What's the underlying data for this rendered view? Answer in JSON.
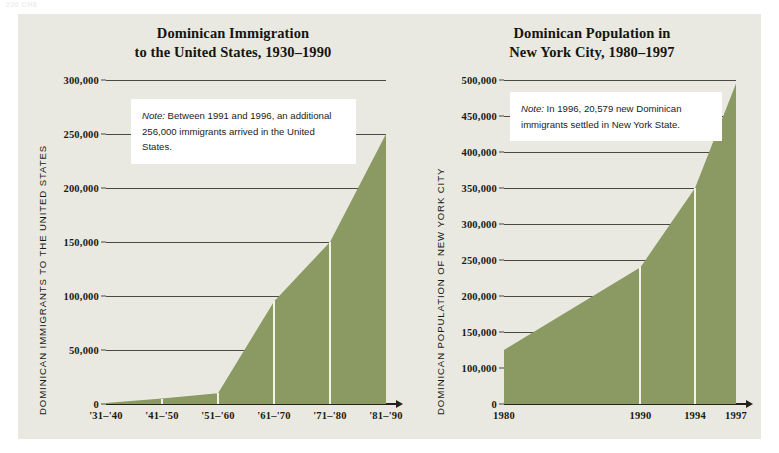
{
  "page_header": "226  CH8",
  "colors": {
    "panel_background": "#e9e9e1",
    "area_fill": "#8a9a62",
    "gridline": "#4a4a40",
    "axis": "#23231c",
    "text": "#1a1a14",
    "note_background": "#ffffff"
  },
  "charts": [
    {
      "id": "dominican-immigration-us",
      "title_line1": "Dominican Immigration",
      "title_line2": "to the United States, 1930–1990",
      "ylabel": "DOMINICAN IMMIGRANTS TO THE UNITED STATES",
      "note_prefix": "Note:",
      "note_body": " Between 1991 and 1996, an additional 256,000 immigrants arrived in the United States.",
      "yticks": [
        "0",
        "50,000",
        "100,000",
        "150,000",
        "200,000",
        "250,000",
        "300,000"
      ],
      "xticks": [
        "'31–'40",
        "'41–'50",
        "'51–'60",
        "'61–'70",
        "'71–'80",
        "'81–'90"
      ]
    },
    {
      "id": "dominican-population-nyc",
      "title_line1": "Dominican Population in",
      "title_line2": "New York City, 1980–1997",
      "ylabel": "DOMINICAN POPULATION OF NEW YORK CITY",
      "note_prefix": "Note:",
      "note_body": " In 1996, 20,579 new Dominican immigrants settled in New York State.",
      "yticks": [
        "0",
        "100,000",
        "150,000",
        "200,000",
        "250,000",
        "300,000",
        "350,000",
        "400,000",
        "450,000",
        "500,000"
      ],
      "xticks": [
        "1980",
        "1990",
        "1994",
        "1997"
      ]
    }
  ],
  "chart_data": [
    {
      "type": "area",
      "title": "Dominican Immigration to the United States, 1930–1990",
      "xlabel": "",
      "ylabel": "DOMINICAN IMMIGRANTS TO THE UNITED STATES",
      "categories": [
        "'31–'40",
        "'41–'50",
        "'51–'60",
        "'61–'70",
        "'71–'80",
        "'81–'90"
      ],
      "values": [
        1000,
        5000,
        10000,
        95000,
        150000,
        250000
      ],
      "ylim": [
        0,
        300000
      ],
      "ytick_values": [
        0,
        50000,
        100000,
        150000,
        200000,
        250000,
        300000
      ],
      "grid": true,
      "legend": "none",
      "annotations": [
        "Note: Between 1991 and 1996, an additional 256,000 immigrants arrived in the United States."
      ]
    },
    {
      "type": "area",
      "title": "Dominican Population in New York City, 1980–1997",
      "xlabel": "",
      "ylabel": "DOMINICAN POPULATION OF NEW YORK CITY",
      "categories": [
        "1980",
        "1990",
        "1994",
        "1997"
      ],
      "x": [
        1980,
        1990,
        1994,
        1997
      ],
      "values": [
        125000,
        240000,
        350000,
        495000
      ],
      "ylim": [
        0,
        500000
      ],
      "ytick_values": [
        0,
        100000,
        150000,
        200000,
        250000,
        300000,
        350000,
        400000,
        450000,
        500000
      ],
      "grid": true,
      "legend": "none",
      "annotations": [
        "Note: In 1996, 20,579 new Dominican immigrants settled in New York State."
      ]
    }
  ]
}
